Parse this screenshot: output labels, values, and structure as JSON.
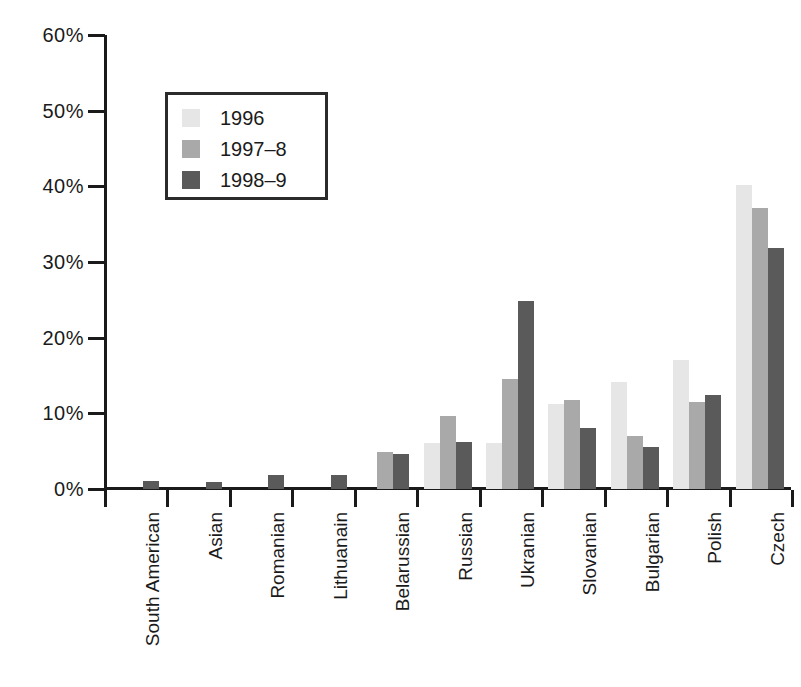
{
  "chart_data": {
    "type": "bar",
    "title": "",
    "subtitle": "",
    "xlabel": "",
    "ylabel": "",
    "ylim": [
      0,
      60
    ],
    "y_unit": "%",
    "grid": false,
    "legend_position": "upper-left-inside",
    "y_ticks": [
      "0%",
      "10%",
      "20%",
      "30%",
      "40%",
      "50%",
      "60%"
    ],
    "y_tick_values": [
      0,
      10,
      20,
      30,
      40,
      50,
      60
    ],
    "categories": [
      "South American",
      "Asian",
      "Romanian",
      "Lithuanain",
      "Belarussian",
      "Russian",
      "Ukranian",
      "Slovanian",
      "Bulgarian",
      "Polish",
      "Czech"
    ],
    "series": [
      {
        "name": "1996",
        "color": "#e6e6e6",
        "values": [
          0,
          0,
          0,
          0,
          0,
          6.1,
          6.1,
          11.2,
          14.2,
          17.0,
          40.2
        ]
      },
      {
        "name": "1997-8",
        "color": "#a9a9a9",
        "values": [
          0,
          0,
          0,
          0,
          4.9,
          9.7,
          14.5,
          11.7,
          7.0,
          11.5,
          37.2
        ]
      },
      {
        "name": "1998-9",
        "color": "#5a5a5a",
        "values": [
          1.0,
          0.9,
          1.9,
          1.9,
          4.6,
          6.2,
          24.8,
          8.1,
          5.6,
          12.4,
          31.8
        ]
      }
    ],
    "legend_entries": [
      "1996",
      "1997–8",
      "1998–9"
    ]
  },
  "legend": {
    "items": [
      {
        "label": "1996",
        "swatch": "light-gray-swatch"
      },
      {
        "label": "1997–8",
        "swatch": "medium-gray-swatch"
      },
      {
        "label": "1998–9",
        "swatch": "dark-gray-swatch"
      }
    ]
  },
  "colors": {
    "series_1996": "#e6e6e6",
    "series_1997_8": "#a9a9a9",
    "series_1998_9": "#5a5a5a",
    "axis": "#1a1a1a",
    "background": "#ffffff"
  }
}
